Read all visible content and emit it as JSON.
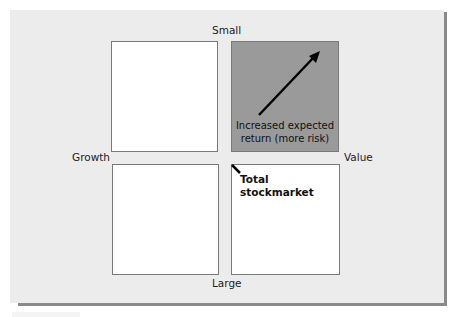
{
  "diagram": {
    "axis_labels": {
      "top": "Small",
      "bottom": "Large",
      "left": "Growth",
      "right": "Value"
    },
    "quadrants": [
      {
        "position": "small-growth",
        "highlighted": false
      },
      {
        "position": "small-value",
        "highlighted": true,
        "annotation": "Increased expected return (more risk)",
        "annotation_line1": "Increased expected",
        "annotation_line2": "return (more risk)"
      },
      {
        "position": "large-growth",
        "highlighted": false
      },
      {
        "position": "large-value",
        "highlighted": false
      }
    ],
    "center_annotation": "Total stockmarket",
    "colors": {
      "panel_bg": "#ececec",
      "highlight": "#9a9a9a",
      "box_border": "#7a7a7a",
      "shadow": "#8a8a8a"
    }
  }
}
